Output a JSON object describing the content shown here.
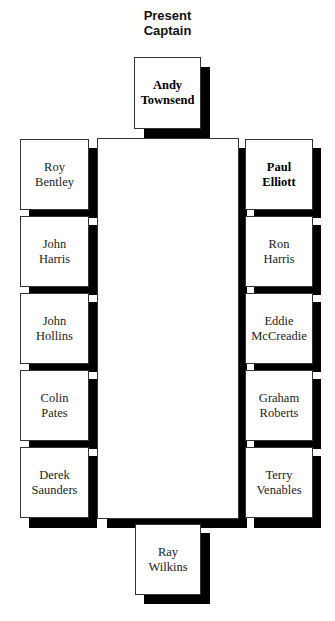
{
  "title": {
    "line1": "Present",
    "line2": "Captain"
  },
  "captain": {
    "first": "Andy",
    "last": "Townsend",
    "bold": true
  },
  "left_seats": [
    {
      "first": "Roy",
      "last": "Bentley"
    },
    {
      "first": "John",
      "last": "Harris"
    },
    {
      "first": "John",
      "last": "Hollins"
    },
    {
      "first": "Colin",
      "last": "Pates"
    },
    {
      "first": "Derek",
      "last": "Saunders"
    }
  ],
  "right_seats": [
    {
      "first": "Paul",
      "last": "Elliott",
      "bold": true
    },
    {
      "first": "Ron",
      "last": "Harris"
    },
    {
      "first": "Eddie",
      "last": "McCreadie"
    },
    {
      "first": "Graham",
      "last": "Roberts"
    },
    {
      "first": "Terry",
      "last": "Venables"
    }
  ],
  "bottom_seat": {
    "first": "Ray",
    "last": "Wilkins"
  },
  "colors": {
    "shadow": "#000000",
    "box_border": "#333333",
    "background": "#ffffff"
  }
}
